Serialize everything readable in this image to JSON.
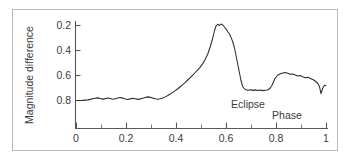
{
  "figure": {
    "border_color": "#b9b9b9",
    "background": "#ffffff",
    "axis_color": "#555a5e",
    "curve_color": "#2b2b2f"
  },
  "labels": {
    "y_axis_title": "Magnitude difference",
    "x_axis_title": "Phase",
    "eclipse_annotation": "Eclipse"
  },
  "axis_ticks": {
    "x": [
      "0",
      "0.2",
      "0.4",
      "0.6",
      "0.8",
      "1"
    ],
    "y": [
      "0.2",
      "0.4",
      "0.6",
      "0.8"
    ]
  },
  "chart_data": {
    "type": "line",
    "title": "",
    "xlabel": "Phase",
    "ylabel": "Magnitude difference",
    "xlim": [
      0,
      1
    ],
    "ylim": [
      0.88,
      0.13
    ],
    "y_inverted": true,
    "grid": false,
    "legend": null,
    "xticks": [
      0,
      0.2,
      0.4,
      0.6,
      0.8,
      1
    ],
    "xtick_labels": [
      "0",
      "0.2",
      "0.4",
      "0.6",
      "0.8",
      "1"
    ],
    "x_minor_tick_step": 0.1,
    "yticks": [
      0.2,
      0.4,
      0.6,
      0.8
    ],
    "ytick_labels": [
      "0.2",
      "0.4",
      "0.6",
      "0.8"
    ],
    "annotations": [
      {
        "text": "Eclipse",
        "x": 0.7,
        "y": 0.855
      },
      {
        "text": "Phase",
        "x": 0.85,
        "y": 0.925
      }
    ],
    "series": [
      {
        "name": "light curve",
        "x": [
          0.005,
          0.015,
          0.025,
          0.035,
          0.045,
          0.055,
          0.065,
          0.075,
          0.085,
          0.095,
          0.105,
          0.115,
          0.125,
          0.135,
          0.145,
          0.155,
          0.165,
          0.175,
          0.185,
          0.195,
          0.205,
          0.215,
          0.225,
          0.235,
          0.245,
          0.255,
          0.265,
          0.275,
          0.285,
          0.295,
          0.305,
          0.315,
          0.325,
          0.335,
          0.345,
          0.355,
          0.365,
          0.375,
          0.385,
          0.395,
          0.405,
          0.415,
          0.425,
          0.435,
          0.445,
          0.455,
          0.465,
          0.475,
          0.485,
          0.495,
          0.505,
          0.515,
          0.525,
          0.535,
          0.545,
          0.552,
          0.558,
          0.565,
          0.572,
          0.578,
          0.585,
          0.592,
          0.598,
          0.605,
          0.612,
          0.618,
          0.625,
          0.632,
          0.638,
          0.645,
          0.652,
          0.658,
          0.665,
          0.675,
          0.685,
          0.695,
          0.705,
          0.715,
          0.725,
          0.735,
          0.745,
          0.755,
          0.762,
          0.768,
          0.775,
          0.782,
          0.788,
          0.795,
          0.805,
          0.815,
          0.825,
          0.835,
          0.845,
          0.855,
          0.865,
          0.875,
          0.885,
          0.895,
          0.905,
          0.915,
          0.925,
          0.935,
          0.945,
          0.952,
          0.958,
          0.965,
          0.972,
          0.978,
          0.985,
          0.992,
          0.998
        ],
        "y": [
          0.8,
          0.8,
          0.799,
          0.797,
          0.795,
          0.791,
          0.786,
          0.782,
          0.779,
          0.784,
          0.789,
          0.785,
          0.78,
          0.784,
          0.79,
          0.786,
          0.78,
          0.776,
          0.781,
          0.788,
          0.792,
          0.787,
          0.782,
          0.786,
          0.791,
          0.787,
          0.782,
          0.776,
          0.771,
          0.775,
          0.781,
          0.786,
          0.79,
          0.786,
          0.78,
          0.771,
          0.76,
          0.748,
          0.735,
          0.721,
          0.706,
          0.69,
          0.673,
          0.655,
          0.636,
          0.617,
          0.597,
          0.576,
          0.555,
          0.533,
          0.505,
          0.47,
          0.428,
          0.37,
          0.3,
          0.24,
          0.205,
          0.19,
          0.2,
          0.188,
          0.196,
          0.212,
          0.228,
          0.25,
          0.268,
          0.295,
          0.33,
          0.38,
          0.44,
          0.51,
          0.58,
          0.64,
          0.69,
          0.712,
          0.718,
          0.714,
          0.719,
          0.715,
          0.72,
          0.716,
          0.721,
          0.718,
          0.716,
          0.712,
          0.7,
          0.678,
          0.65,
          0.62,
          0.598,
          0.586,
          0.58,
          0.576,
          0.582,
          0.59,
          0.588,
          0.596,
          0.604,
          0.6,
          0.61,
          0.618,
          0.614,
          0.624,
          0.632,
          0.64,
          0.65,
          0.662,
          0.69,
          0.745,
          0.7,
          0.678,
          0.682
        ]
      }
    ]
  }
}
